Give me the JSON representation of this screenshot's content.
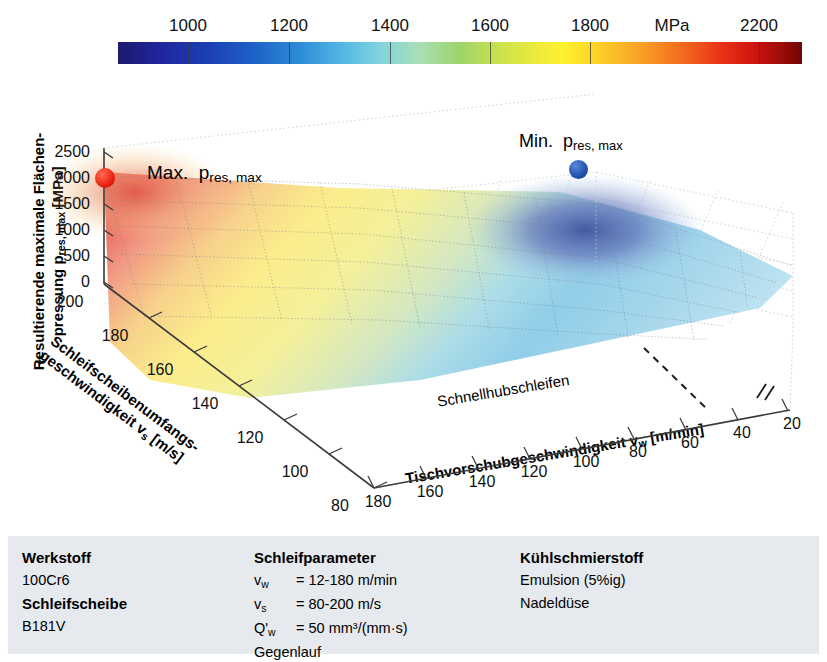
{
  "chart_data": {
    "type": "surface",
    "title": "",
    "xlabel": "Tischvorschubgeschwindigkeit v_w [m/min]",
    "zlabel": "Schleifscheibenumfangsgeschwindigkeit v_s [m/s]",
    "ylabel": "Resultierende maximale Flächenpressung p_res,max [MPa]",
    "x_ticks": [
      180,
      160,
      140,
      120,
      100,
      80,
      60,
      40,
      20
    ],
    "x_axis_break": "//",
    "z_ticks": [
      200,
      180,
      160,
      140,
      120,
      100,
      80
    ],
    "y_ticks": [
      2500,
      2000,
      1500,
      1000,
      500,
      0
    ],
    "ylim": [
      0,
      2500
    ],
    "colorbar": {
      "label": "MPa",
      "ticks": [
        1000,
        1200,
        1400,
        1600,
        1800,
        2200
      ],
      "min": 800,
      "max": 2300,
      "colormap": "jet"
    },
    "markers": [
      {
        "name": "max",
        "label": "Max.  p",
        "sub": "res, max",
        "value": 2200,
        "color": "#e81d0c",
        "x": 180,
        "z": 200
      },
      {
        "name": "min",
        "label": "Min.  p",
        "sub": "res, max",
        "value": 900,
        "color": "#1b4ea8",
        "x": 60,
        "z": 200
      }
    ],
    "region_label": "Schnellhubschleifen",
    "grid": true,
    "surface_note": "Pressure decreases from max at high v_w / high v_s toward min at low v_w"
  },
  "colorbar": {
    "unit": "MPa",
    "labels": [
      {
        "text": "1000",
        "pos": 188
      },
      {
        "text": "1200",
        "pos": 289
      },
      {
        "text": "1400",
        "pos": 390
      },
      {
        "text": "1600",
        "pos": 490
      },
      {
        "text": "1800",
        "pos": 590
      },
      {
        "text": "MPa",
        "pos": 672
      },
      {
        "text": "2200",
        "pos": 759
      }
    ]
  },
  "axes": {
    "y_title_line1": "Resultierende maximale Flächen-",
    "y_title_line2_pre": "pressung p",
    "y_title_line2_sub": "res, max",
    "y_title_line2_post": " [MPa]",
    "x_title_pre": "Tischvorschubgeschwindigkeit v",
    "x_title_sub": "w",
    "x_title_post": " [m/min]",
    "z_title_line1": "Schleifscheibenumfangs-",
    "z_title_line2_pre": "geschwindigkeit v",
    "z_title_line2_sub": "s",
    "z_title_line2_post": " [m/s]",
    "y_ticks": [
      "2500",
      "2000",
      "1500",
      "1000",
      "500",
      "0"
    ],
    "z_ticks": [
      "200",
      "180",
      "160",
      "140",
      "120",
      "100",
      "80"
    ],
    "x_ticks": [
      "180",
      "160",
      "140",
      "120",
      "100",
      "80",
      "60",
      "40",
      "20"
    ],
    "break_mark": "//"
  },
  "annotations": {
    "max_label": "Max.",
    "max_symbol": "p",
    "max_sub": "res, max",
    "min_label": "Min.",
    "min_symbol": "p",
    "min_sub": "res, max",
    "region": "Schnellhubschleifen"
  },
  "info": {
    "col1": {
      "heading1": "Werkstoff",
      "value1": "100Cr6",
      "heading2": "Schleifscheibe",
      "value2": "B181V"
    },
    "col2": {
      "heading": "Schleifparameter",
      "rows": [
        {
          "sym": "v",
          "sub": "w",
          "val": "= 12-180 m/min"
        },
        {
          "sym": "v",
          "sub": "s",
          "val": "= 80-200 m/s"
        },
        {
          "sym": "Q'",
          "sub": "w",
          "val": "= 50 mm³/(mm·s)"
        }
      ],
      "footer": "Gegenlauf"
    },
    "col3": {
      "heading": "Kühlschmierstoff",
      "value1": "Emulsion (5%ig)",
      "value2": "Nadeldüse"
    }
  },
  "colors": {
    "panel_bg": "#e6eaee",
    "max_marker": "#e81d0c",
    "min_marker": "#1b4ea8",
    "axis": "#222222"
  }
}
